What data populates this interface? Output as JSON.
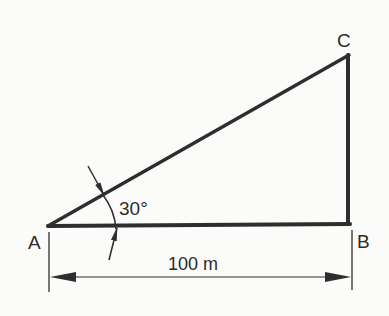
{
  "diagram": {
    "type": "right-triangle",
    "vertices": {
      "A": {
        "label": "A"
      },
      "B": {
        "label": "B"
      },
      "C": {
        "label": "C"
      }
    },
    "angle": {
      "at": "A",
      "label": "30°",
      "value_deg": 30
    },
    "dimension": {
      "from": "A",
      "to": "B",
      "label": "100 m",
      "value": 100,
      "unit": "m"
    },
    "colors": {
      "line": "#2e2e2e",
      "text": "#2b2b2b",
      "background": "#fbfbfa"
    }
  }
}
